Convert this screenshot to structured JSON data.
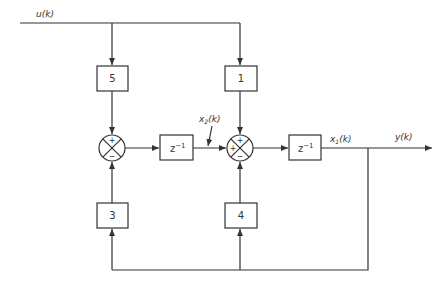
{
  "signals": {
    "input": "u(k)",
    "output": "y(k)",
    "state1_base": "x",
    "state1_sub": "1",
    "state1_arg": "(k)",
    "state2_base": "x",
    "state2_sub": "2",
    "state2_arg": "(k)"
  },
  "blocks": {
    "gain_top_left": "5",
    "gain_top_right": "1",
    "gain_bottom_left": "3",
    "gain_bottom_right": "4",
    "delay_base": "z",
    "delay_exp": "−1"
  },
  "junctions": {
    "left": {
      "top": "+",
      "bottom": "−"
    },
    "right": {
      "top": "+",
      "left": "+",
      "bottom": "−"
    }
  },
  "colors": {
    "stroke": "#333333",
    "background": "#ffffff"
  }
}
